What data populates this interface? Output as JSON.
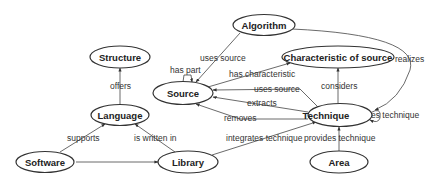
{
  "diagram": {
    "type": "concept-map",
    "nodes": {
      "algorithm": "Algorithm",
      "structure": "Structure",
      "characteristic": "Characteristic of source",
      "source": "Source",
      "language": "Language",
      "technique": "Technique",
      "software": "Software",
      "library": "Library",
      "area": "Area"
    },
    "edges": {
      "algorithm_source": "uses source",
      "algorithm_technique": "realizes",
      "source_self": "has part",
      "source_characteristic": "has characteristic",
      "technique_source_uses": "uses source",
      "technique_source_extracts": "extracts",
      "technique_source_removes": "removes",
      "technique_characteristic": "considers",
      "technique_self": "uses technique",
      "language_structure": "offers",
      "software_language": "supports",
      "library_language": "is written in",
      "software_library": "integrates library",
      "library_technique": "integrates technique",
      "area_technique": "provides technique"
    }
  }
}
